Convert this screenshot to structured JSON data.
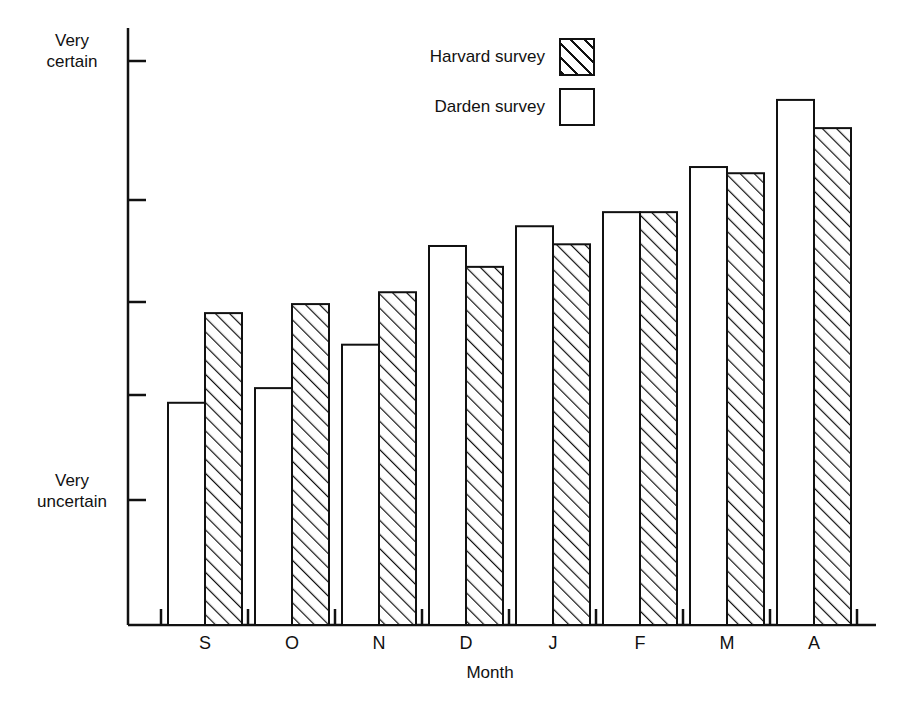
{
  "chart_data": {
    "type": "bar",
    "title": "",
    "subtitle": "",
    "xlabel": "Month",
    "ylabel": "",
    "categories": [
      "S",
      "O",
      "N",
      "D",
      "J",
      "F",
      "M",
      "A"
    ],
    "series": [
      {
        "name": "Darden survey",
        "style": "open",
        "values": [
          3.94,
          4.2,
          4.97,
          6.72,
          7.07,
          7.32,
          8.12,
          9.31
        ]
      },
      {
        "name": "Harvard survey",
        "style": "hatched",
        "values": [
          5.53,
          5.69,
          5.9,
          6.35,
          6.75,
          7.32,
          8.01,
          8.81
        ]
      }
    ],
    "ylim": [
      0,
      10
    ],
    "y_axis_top_label": "Very\ncertain",
    "y_axis_bottom_label": "Very\nuncertain",
    "y_tick_values": [
      10.0,
      7.53,
      5.73,
      4.08,
      2.22
    ],
    "grid": false,
    "legend_position": "top-center"
  },
  "axes": {
    "y_top_label": "Very\ncertain",
    "y_bottom_label": "Very\nuncertain",
    "x_title": "Month",
    "x_tick_labels": [
      "S",
      "O",
      "N",
      "D",
      "J",
      "F",
      "M",
      "A"
    ]
  },
  "legend": {
    "entries": [
      {
        "label": "Harvard survey",
        "swatch": "hatched-swatch"
      },
      {
        "label": "Darden survey",
        "swatch": "open-swatch"
      }
    ]
  },
  "colors": {
    "ink": "#111111",
    "paper": "#ffffff"
  }
}
